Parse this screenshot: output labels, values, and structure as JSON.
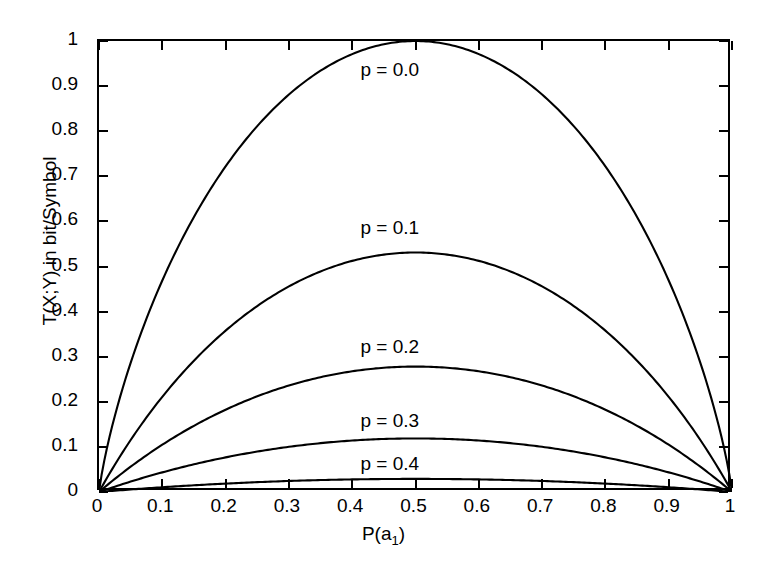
{
  "chart_data": {
    "type": "line",
    "title": "",
    "xlabel": "P(a_1)",
    "xlabel_base": "P(a",
    "xlabel_sub": "1",
    "xlabel_tail": ")",
    "ylabel": "T(X;Y) in bit/Symbol",
    "xlim": [
      0,
      1
    ],
    "ylim": [
      0,
      1
    ],
    "grid": false,
    "legend_position": "inline-annotations",
    "xticks": [
      0,
      0.1,
      0.2,
      0.3,
      0.4,
      0.5,
      0.6,
      0.7,
      0.8,
      0.9,
      1
    ],
    "xticklabels": [
      "0",
      "0.1",
      "0.2",
      "0.3",
      "0.4",
      "0.5",
      "0.6",
      "0.7",
      "0.8",
      "0.9",
      "1"
    ],
    "yticks": [
      0,
      0.1,
      0.2,
      0.3,
      0.4,
      0.5,
      0.6,
      0.7,
      0.8,
      0.9,
      1
    ],
    "yticklabels": [
      "0",
      "0.1",
      "0.2",
      "0.3",
      "0.4",
      "0.5",
      "0.6",
      "0.7",
      "0.8",
      "0.9",
      "1"
    ],
    "x": [
      0,
      0.02,
      0.05,
      0.08,
      0.1,
      0.15,
      0.2,
      0.25,
      0.3,
      0.35,
      0.4,
      0.45,
      0.5,
      0.55,
      0.6,
      0.65,
      0.7,
      0.75,
      0.8,
      0.85,
      0.9,
      0.92,
      0.95,
      0.98,
      1
    ],
    "series": [
      {
        "name": "p = 0.0",
        "p": 0.0,
        "peak_value": 1.0,
        "peak_x": 0.5,
        "label_x": 0.47,
        "label_y": 0.935,
        "values": [
          0,
          0.1414,
          0.2864,
          0.4022,
          0.469,
          0.6098,
          0.7219,
          0.8113,
          0.8813,
          0.9341,
          0.971,
          0.9928,
          1.0,
          0.9928,
          0.971,
          0.9341,
          0.8813,
          0.8113,
          0.7219,
          0.6098,
          0.469,
          0.4022,
          0.2864,
          0.1414,
          0
        ]
      },
      {
        "name": "p = 0.1",
        "p": 0.1,
        "peak_value": 0.531,
        "peak_x": 0.5,
        "label_x": 0.47,
        "label_y": 0.585,
        "values": [
          0,
          0.0664,
          0.1441,
          0.2097,
          0.2482,
          0.3303,
          0.3955,
          0.4471,
          0.4869,
          0.5161,
          0.5355,
          0.5459,
          0.531,
          0.5459,
          0.5355,
          0.5161,
          0.4869,
          0.4471,
          0.3955,
          0.3303,
          0.2482,
          0.2097,
          0.1441,
          0.0664,
          0
        ]
      },
      {
        "name": "p = 0.2",
        "p": 0.2,
        "peak_value": 0.2781,
        "peak_x": 0.5,
        "label_x": 0.47,
        "label_y": 0.322,
        "values": [
          0,
          0.0313,
          0.0707,
          0.1055,
          0.1266,
          0.1737,
          0.2128,
          0.2447,
          0.2699,
          0.2889,
          0.302,
          0.3094,
          0.2781,
          0.3094,
          0.302,
          0.2889,
          0.2699,
          0.2447,
          0.2128,
          0.1737,
          0.1266,
          0.1055,
          0.0707,
          0.0313,
          0
        ]
      },
      {
        "name": "p = 0.3",
        "p": 0.3,
        "peak_value": 0.1187,
        "peak_x": 0.5,
        "label_x": 0.47,
        "label_y": 0.158,
        "values": [
          0,
          0.0126,
          0.029,
          0.0438,
          0.053,
          0.0741,
          0.0923,
          0.1077,
          0.1204,
          0.1305,
          0.1379,
          0.1427,
          0.1187,
          0.1427,
          0.1379,
          0.1305,
          0.1204,
          0.1077,
          0.0923,
          0.0741,
          0.053,
          0.0438,
          0.029,
          0.0126,
          0
        ]
      },
      {
        "name": "p = 0.4",
        "p": 0.4,
        "peak_value": 0.029,
        "peak_x": 0.5,
        "label_x": 0.47,
        "label_y": 0.062,
        "values": [
          0,
          0.003,
          0.007,
          0.0106,
          0.0129,
          0.0182,
          0.0228,
          0.0268,
          0.0301,
          0.0328,
          0.0348,
          0.0361,
          0.029,
          0.0361,
          0.0348,
          0.0328,
          0.0301,
          0.0268,
          0.0228,
          0.0182,
          0.0129,
          0.0106,
          0.007,
          0.003,
          0
        ]
      }
    ],
    "colors": {
      "curve": "#000000",
      "axis": "#000000",
      "background": "#ffffff"
    }
  }
}
